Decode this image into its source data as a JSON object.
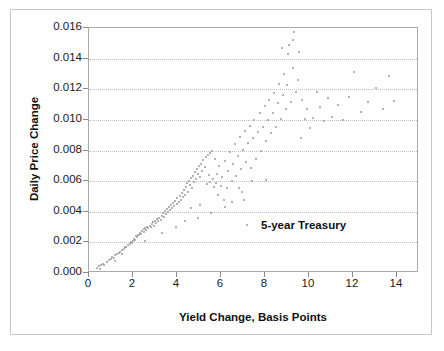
{
  "chart_data": {
    "type": "scatter",
    "title": "",
    "xlabel": "Yield Change, Basis Points",
    "ylabel": "Daily Price Change",
    "xlim": [
      0,
      15
    ],
    "ylim": [
      0.0,
      0.016
    ],
    "xticks": [
      0,
      2,
      4,
      6,
      8,
      10,
      12,
      14
    ],
    "xtick_labels": [
      "0",
      "2",
      "4",
      "6",
      "8",
      "10",
      "12",
      "14"
    ],
    "yticks": [
      0.0,
      0.002,
      0.004,
      0.006,
      0.008,
      0.01,
      0.012,
      0.014,
      0.016
    ],
    "ytick_labels": [
      "0.000",
      "0.002",
      "0.004",
      "0.006",
      "0.008",
      "0.010",
      "0.012",
      "0.014",
      "0.016"
    ],
    "grid": "horizontal-dotted",
    "legend_position": "inside-center-right",
    "marker_color": "#9a9a9a",
    "series": [
      {
        "name": "5-year Treasury",
        "points": [
          [
            0.35,
            0.00035
          ],
          [
            0.45,
            0.00045
          ],
          [
            0.55,
            0.0005
          ],
          [
            0.62,
            0.00062
          ],
          [
            0.7,
            0.00055
          ],
          [
            0.8,
            0.0007
          ],
          [
            0.9,
            0.00082
          ],
          [
            1.0,
            0.0009
          ],
          [
            1.05,
            0.00105
          ],
          [
            1.12,
            0.00098
          ],
          [
            1.2,
            0.00115
          ],
          [
            1.28,
            0.00125
          ],
          [
            1.35,
            0.0013
          ],
          [
            1.42,
            0.0014
          ],
          [
            1.5,
            0.00152
          ],
          [
            1.58,
            0.0016
          ],
          [
            1.62,
            0.00172
          ],
          [
            1.7,
            0.00168
          ],
          [
            1.78,
            0.00182
          ],
          [
            1.85,
            0.0019
          ],
          [
            1.9,
            0.00205
          ],
          [
            1.95,
            0.00198
          ],
          [
            2.0,
            0.0021
          ],
          [
            2.05,
            0.00225
          ],
          [
            2.1,
            0.00218
          ],
          [
            2.12,
            0.0024
          ],
          [
            2.18,
            0.00232
          ],
          [
            2.22,
            0.0025
          ],
          [
            2.28,
            0.00245
          ],
          [
            2.32,
            0.00262
          ],
          [
            2.38,
            0.00255
          ],
          [
            2.42,
            0.00272
          ],
          [
            2.48,
            0.00268
          ],
          [
            2.52,
            0.00285
          ],
          [
            2.55,
            0.00295
          ],
          [
            2.6,
            0.00278
          ],
          [
            2.65,
            0.00302
          ],
          [
            2.7,
            0.00292
          ],
          [
            2.75,
            0.0031
          ],
          [
            2.8,
            0.003
          ],
          [
            2.85,
            0.00318
          ],
          [
            2.9,
            0.0033
          ],
          [
            2.95,
            0.00308
          ],
          [
            3.0,
            0.00342
          ],
          [
            3.05,
            0.00325
          ],
          [
            3.1,
            0.00355
          ],
          [
            3.15,
            0.00338
          ],
          [
            3.2,
            0.00362
          ],
          [
            3.25,
            0.00348
          ],
          [
            3.3,
            0.00375
          ],
          [
            3.35,
            0.00395
          ],
          [
            3.4,
            0.00368
          ],
          [
            3.45,
            0.00405
          ],
          [
            3.5,
            0.00385
          ],
          [
            3.55,
            0.00418
          ],
          [
            3.6,
            0.004
          ],
          [
            3.62,
            0.00432
          ],
          [
            3.68,
            0.00412
          ],
          [
            3.72,
            0.00445
          ],
          [
            3.78,
            0.00425
          ],
          [
            3.82,
            0.0046
          ],
          [
            3.88,
            0.00438
          ],
          [
            3.92,
            0.00472
          ],
          [
            3.98,
            0.00452
          ],
          [
            4.02,
            0.0049
          ],
          [
            4.08,
            0.00465
          ],
          [
            4.12,
            0.00505
          ],
          [
            4.18,
            0.0048
          ],
          [
            4.22,
            0.0052
          ],
          [
            4.28,
            0.00498
          ],
          [
            4.32,
            0.00545
          ],
          [
            4.38,
            0.00512
          ],
          [
            4.42,
            0.0056
          ],
          [
            4.45,
            0.00588
          ],
          [
            4.5,
            0.0053
          ],
          [
            4.55,
            0.00602
          ],
          [
            4.58,
            0.00572
          ],
          [
            4.62,
            0.00618
          ],
          [
            4.68,
            0.00555
          ],
          [
            4.72,
            0.00635
          ],
          [
            4.78,
            0.00592
          ],
          [
            4.82,
            0.0066
          ],
          [
            4.88,
            0.00612
          ],
          [
            4.92,
            0.00678
          ],
          [
            4.95,
            0.00648
          ],
          [
            5.0,
            0.007
          ],
          [
            5.05,
            0.00628
          ],
          [
            5.1,
            0.00715
          ],
          [
            5.15,
            0.00665
          ],
          [
            5.2,
            0.00738
          ],
          [
            5.25,
            0.0069
          ],
          [
            5.3,
            0.00755
          ],
          [
            5.35,
            0.00578
          ],
          [
            5.4,
            0.00772
          ],
          [
            5.45,
            0.0064
          ],
          [
            5.5,
            0.00785
          ],
          [
            5.52,
            0.00595
          ],
          [
            5.58,
            0.008
          ],
          [
            5.62,
            0.00615
          ],
          [
            5.68,
            0.0056
          ],
          [
            5.72,
            0.00742
          ],
          [
            5.78,
            0.00585
          ],
          [
            5.82,
            0.00648
          ],
          [
            5.88,
            0.00512
          ],
          [
            5.92,
            0.007
          ],
          [
            5.98,
            0.00565
          ],
          [
            6.05,
            0.00625
          ],
          [
            6.12,
            0.0048
          ],
          [
            6.18,
            0.0073
          ],
          [
            6.25,
            0.00552
          ],
          [
            6.32,
            0.00668
          ],
          [
            6.4,
            0.00788
          ],
          [
            6.48,
            0.00602
          ],
          [
            6.55,
            0.00712
          ],
          [
            6.62,
            0.00845
          ],
          [
            6.7,
            0.00635
          ],
          [
            6.78,
            0.00762
          ],
          [
            6.85,
            0.0089
          ],
          [
            6.92,
            0.0068
          ],
          [
            7.0,
            0.00805
          ],
          [
            7.08,
            0.00925
          ],
          [
            7.15,
            0.00722
          ],
          [
            7.22,
            0.00852
          ],
          [
            7.3,
            0.00962
          ],
          [
            7.38,
            0.00688
          ],
          [
            7.45,
            0.00882
          ],
          [
            7.52,
            0.01002
          ],
          [
            7.6,
            0.00745
          ],
          [
            7.68,
            0.00918
          ],
          [
            7.75,
            0.01042
          ],
          [
            7.82,
            0.008
          ],
          [
            7.9,
            0.00952
          ],
          [
            7.98,
            0.0109
          ],
          [
            8.05,
            0.00862
          ],
          [
            8.12,
            0.00998
          ],
          [
            8.2,
            0.01132
          ],
          [
            8.28,
            0.00912
          ],
          [
            8.35,
            0.01042
          ],
          [
            8.42,
            0.01175
          ],
          [
            8.5,
            0.00955
          ],
          [
            8.58,
            0.0111
          ],
          [
            8.65,
            0.01232
          ],
          [
            8.72,
            0.01005
          ],
          [
            8.8,
            0.01162
          ],
          [
            8.88,
            0.01302
          ],
          [
            8.95,
            0.01068
          ],
          [
            9.02,
            0.01228
          ],
          [
            9.1,
            0.01488
          ],
          [
            9.18,
            0.01118
          ],
          [
            9.25,
            0.01338
          ],
          [
            9.32,
            0.01575
          ],
          [
            9.4,
            0.01182
          ],
          [
            9.48,
            0.01262
          ],
          [
            9.55,
            0.01445
          ],
          [
            9.62,
            0.0088
          ],
          [
            9.7,
            0.01128
          ],
          [
            9.8,
            0.01008
          ],
          [
            9.92,
            0.01072
          ],
          [
            10.05,
            0.00948
          ],
          [
            10.2,
            0.01012
          ],
          [
            10.35,
            0.01182
          ],
          [
            10.5,
            0.01085
          ],
          [
            10.68,
            0.00992
          ],
          [
            10.85,
            0.01142
          ],
          [
            11.05,
            0.01022
          ],
          [
            11.3,
            0.01098
          ],
          [
            11.55,
            0.00998
          ],
          [
            11.8,
            0.01152
          ],
          [
            12.05,
            0.01312
          ],
          [
            12.35,
            0.01052
          ],
          [
            12.7,
            0.01118
          ],
          [
            13.05,
            0.01208
          ],
          [
            13.35,
            0.01068
          ],
          [
            13.62,
            0.01288
          ],
          [
            13.85,
            0.01122
          ],
          [
            9.05,
            0.01432
          ],
          [
            8.78,
            0.01468
          ],
          [
            9.28,
            0.01522
          ],
          [
            6.95,
            0.0053
          ],
          [
            7.4,
            0.006
          ],
          [
            8.05,
            0.0061
          ],
          [
            6.2,
            0.00432
          ],
          [
            5.05,
            0.00442
          ],
          [
            4.65,
            0.00422
          ],
          [
            3.3,
            0.00262
          ],
          [
            2.55,
            0.00212
          ],
          [
            1.48,
            0.00122
          ],
          [
            1.18,
            0.00078
          ],
          [
            0.5,
            0.00028
          ],
          [
            4.95,
            0.00362
          ],
          [
            5.55,
            0.00392
          ],
          [
            6.5,
            0.00465
          ],
          [
            7.05,
            0.00478
          ],
          [
            4.35,
            0.0034
          ],
          [
            3.95,
            0.003
          ],
          [
            6.8,
            0.00558
          ]
        ]
      }
    ]
  },
  "legend": {
    "label": "5-year Treasury"
  }
}
